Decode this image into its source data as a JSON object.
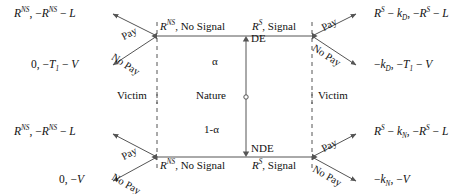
{
  "diagram": {
    "type": "game-tree",
    "stroke_color": "#555555",
    "text_color": "#111111"
  },
  "nature": {
    "label": "Nature",
    "branch_up_prob": "α",
    "branch_down_prob": "1-α",
    "branch_up_name": "DE",
    "branch_down_name": "NDE"
  },
  "players": {
    "victim_left_top": "Victim",
    "victim_right_top": "Victim",
    "victim_left_bottom": "Victim",
    "victim_right_bottom": "Victim"
  },
  "signals": {
    "top_left": {
      "payoff": "R",
      "sup": "NS",
      "rest": ", No Signal"
    },
    "top_right": {
      "payoff": "R",
      "sup": "S",
      "rest": ", Signal"
    },
    "bottom_left": {
      "payoff": "R",
      "sup": "NS",
      "rest": ", No Signal"
    },
    "bottom_right": {
      "payoff": "R",
      "sup": "S",
      "rest": ", Signal"
    }
  },
  "actions": {
    "top_left_pay": "Pay",
    "top_left_nopay": "No Pay",
    "top_right_pay": "Pay",
    "top_right_nopay": "No Pay",
    "bottom_left_pay": "Pay",
    "bottom_left_nopay": "No Pay",
    "bottom_right_pay": "Pay",
    "bottom_right_nopay": "No Pay"
  },
  "payoffs": {
    "top_left_pay": "R^{NS}, -R^{NS} - L",
    "top_left_nopay": "0, -T_1 - V",
    "top_right_pay": "R^{S} - k_D, -R^{S} - L",
    "top_right_nopay": "-k_D, -T_1 - V",
    "bottom_left_pay": "R^{NS}, -R^{NS} - L",
    "bottom_left_nopay": "0, -V",
    "bottom_right_pay": "R^{S} - k_N, -R^{S} - L",
    "bottom_right_nopay": "-k_N, -V"
  }
}
